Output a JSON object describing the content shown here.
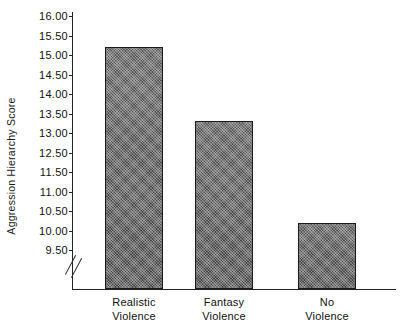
{
  "chart_data": {
    "type": "bar",
    "title": "",
    "subtitle": "",
    "xlabel": "",
    "ylabel": "Aggression Hierarchy Score",
    "categories": [
      "Realistic Violence",
      "Fantasy Violence",
      "No Violence"
    ],
    "category_lines": [
      [
        "Realistic",
        "Violence"
      ],
      [
        "Fantasy",
        "Violence"
      ],
      [
        "No",
        "Violence"
      ]
    ],
    "values": [
      15.2,
      13.3,
      10.2
    ],
    "ylim": [
      9.5,
      16.0
    ],
    "y_tick_labels": [
      "16.00",
      "15.50",
      "15.00",
      "14.50",
      "14.00",
      "13.50",
      "13.00",
      "12.50",
      "11.50",
      "11.00",
      "10.50",
      "10.00",
      "9.50"
    ],
    "y_axis_broken": true,
    "grid": false,
    "legend": null,
    "legend_position": "none",
    "bar_fill_color": "#4a4a4a",
    "bar_edge_color": "#1b1b1b",
    "axis_color": "#242424",
    "background_color": "#ffffff"
  }
}
